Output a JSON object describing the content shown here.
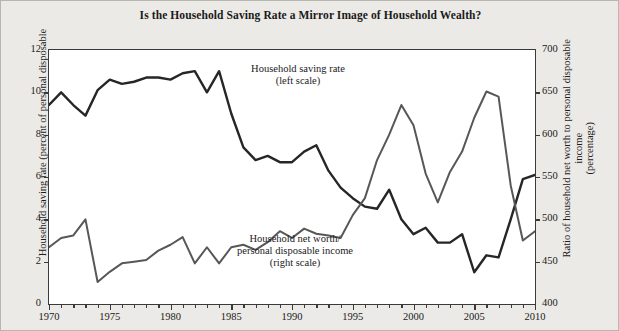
{
  "chart_data": {
    "type": "line",
    "title": "Is the Household Saving Rate a Mirror Image of Household Wealth?",
    "xlabel": "",
    "ylabel": "Household saving rate (percent of personal disposable\nincome)",
    "ylabel_right": "Ratio of household net worth to personal disposable income\n(percentage)",
    "xlim": [
      1970,
      2010
    ],
    "ylim": [
      0,
      12
    ],
    "ylim_right": [
      400,
      700
    ],
    "yticks": [
      0,
      2,
      4,
      6,
      8,
      10,
      12
    ],
    "yticks_right": [
      400,
      450,
      500,
      550,
      600,
      650,
      700
    ],
    "xticks": [
      1970,
      1975,
      1980,
      1985,
      1990,
      1995,
      2000,
      2005,
      2010
    ],
    "xtick_step_minor": 1,
    "grid": false,
    "legend_position": "inline-annotations",
    "x": [
      1970,
      1971,
      1972,
      1973,
      1974,
      1975,
      1976,
      1977,
      1978,
      1979,
      1980,
      1981,
      1982,
      1983,
      1984,
      1985,
      1986,
      1987,
      1988,
      1989,
      1990,
      1991,
      1992,
      1993,
      1994,
      1995,
      1996,
      1997,
      1998,
      1999,
      2000,
      2001,
      2002,
      2003,
      2004,
      2005,
      2006,
      2007,
      2008,
      2009,
      2010
    ],
    "series": [
      {
        "name": "Household saving rate",
        "scale": "left",
        "annotation": "Household saving rate\n(left scale)",
        "color": "#262626",
        "units": "percent of personal disposable income",
        "values": [
          9.4,
          10.0,
          9.4,
          8.9,
          10.1,
          10.6,
          10.4,
          10.5,
          10.7,
          10.7,
          10.6,
          10.9,
          11.0,
          10.0,
          11.0,
          9.0,
          7.4,
          6.8,
          7.0,
          6.7,
          6.7,
          7.2,
          7.5,
          6.3,
          5.5,
          5.0,
          4.6,
          4.5,
          5.4,
          4.0,
          3.3,
          3.6,
          2.9,
          2.9,
          3.3,
          1.5,
          2.3,
          2.2,
          4.0,
          5.9,
          6.1
        ]
      },
      {
        "name": "Household net worth/personal disposable income",
        "scale": "right",
        "annotation": "Household net worth/\npersonal disposable income\n(right scale)",
        "color": "#575757",
        "units": "percentage",
        "values": [
          467,
          478,
          481,
          500,
          426,
          438,
          448,
          450,
          452,
          463,
          470,
          479,
          448,
          467,
          448,
          467,
          470,
          464,
          473,
          486,
          478,
          489,
          483,
          481,
          478,
          505,
          525,
          570,
          600,
          635,
          611,
          554,
          520,
          556,
          580,
          620,
          651,
          645,
          540,
          475,
          486
        ]
      }
    ]
  }
}
